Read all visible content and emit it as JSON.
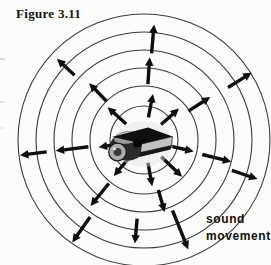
{
  "figure": {
    "title": "Figure 3.11",
    "label": {
      "line1": "sound",
      "line2": "movement"
    }
  },
  "diagram": {
    "center": {
      "x": 144,
      "y": 140
    },
    "ring_radii": [
      34,
      54,
      72,
      90,
      108,
      126
    ],
    "ring_color": "#3b3b3b",
    "ring_width": 1.1,
    "arrow_color": "#0e0e0e",
    "arrow_width": 3.4,
    "arrows": [
      {
        "angle": 79,
        "r0": 23,
        "r1": 47
      },
      {
        "angle": 42,
        "r0": 23,
        "r1": 47
      },
      {
        "angle": -13,
        "r0": 26,
        "r1": 51
      },
      {
        "angle": -44,
        "r0": 24,
        "r1": 53
      },
      {
        "angle": -80,
        "r0": 23,
        "r1": 47
      },
      {
        "angle": -130,
        "r0": 23,
        "r1": 47
      },
      {
        "angle": 189,
        "r0": 28,
        "r1": 46
      },
      {
        "angle": 138,
        "r0": 24,
        "r1": 49
      },
      {
        "angle": 86,
        "r0": 56,
        "r1": 83
      },
      {
        "angle": 33,
        "r0": 53,
        "r1": 79
      },
      {
        "angle": -14,
        "r0": 60,
        "r1": 90
      },
      {
        "angle": -74,
        "r0": 52,
        "r1": 75
      },
      {
        "angle": -129,
        "r0": 56,
        "r1": 85
      },
      {
        "angle": 187,
        "r0": 56,
        "r1": 89
      },
      {
        "angle": 134,
        "r0": 54,
        "r1": 79
      },
      {
        "angle": 85,
        "r0": 87,
        "r1": 116
      },
      {
        "angle": 32,
        "r0": 99,
        "r1": 127
      },
      {
        "angle": -19,
        "r0": 93,
        "r1": 120
      },
      {
        "angle": -68,
        "r0": 76,
        "r1": 118
      },
      {
        "angle": -95,
        "r0": 79,
        "r1": 104
      },
      {
        "angle": -125,
        "r0": 94,
        "r1": 125
      },
      {
        "angle": 187,
        "r0": 98,
        "r1": 125
      },
      {
        "angle": 137,
        "r0": 95,
        "r1": 119
      }
    ]
  },
  "colors": {
    "background": "#fcfcfa",
    "ink": "#141414"
  }
}
